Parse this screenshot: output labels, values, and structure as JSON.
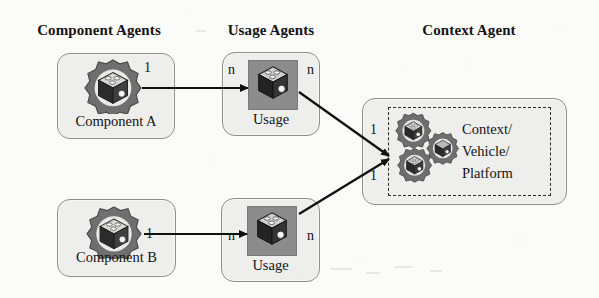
{
  "diagram": {
    "columns": [
      {
        "id": "component-agents",
        "label": "Component Agents"
      },
      {
        "id": "usage-agents",
        "label": "Usage Agents"
      },
      {
        "id": "context-agent",
        "label": "Context Agent"
      }
    ],
    "nodes": [
      {
        "id": "component-a",
        "label": "Component A",
        "column": "component-agents",
        "icon": "component-cube-gear-icon"
      },
      {
        "id": "component-b",
        "label": "Component B",
        "column": "component-agents",
        "icon": "component-cube-gear-icon"
      },
      {
        "id": "usage-a",
        "label": "Usage",
        "column": "usage-agents",
        "icon": "usage-cube-icon"
      },
      {
        "id": "usage-b",
        "label": "Usage",
        "column": "usage-agents",
        "icon": "usage-cube-icon"
      },
      {
        "id": "context",
        "label_lines": [
          "Context/",
          "Vehicle/",
          "Platform"
        ],
        "label": "Context/ Vehicle/ Platform",
        "column": "context-agent",
        "icon": "context-multi-gear-icon"
      }
    ],
    "edges": [
      {
        "id": "component-a-to-usage-a",
        "from": "component-a",
        "to": "usage-a",
        "source_multiplicity": "1",
        "target_multiplicity": "n",
        "style": "solid-arrow"
      },
      {
        "id": "component-b-to-usage-b",
        "from": "component-b",
        "to": "usage-b",
        "source_multiplicity": "1",
        "target_multiplicity": "n",
        "style": "solid-arrow"
      },
      {
        "id": "usage-a-to-context",
        "from": "usage-a",
        "to": "context",
        "source_multiplicity": "n",
        "target_multiplicity": "1",
        "style": "solid-arrow"
      },
      {
        "id": "usage-b-to-context",
        "from": "usage-b",
        "to": "context",
        "source_multiplicity": "n",
        "target_multiplicity": "1",
        "style": "solid-arrow"
      }
    ],
    "multiplicities": {
      "component_a_out": "1",
      "component_b_out": "1",
      "usage_a_in": "n",
      "usage_a_out": "n",
      "usage_b_in": "n",
      "usage_b_out": "n",
      "context_in_top": "1",
      "context_in_bottom": "1"
    },
    "colors": {
      "background": "#fbfbf9",
      "box_fill": "#eeeeec",
      "box_border": "#8d8d8d",
      "tile_fill": "#8c8c8c",
      "icon_gray": "#7c7c7c",
      "icon_dark": "#3a3a3a",
      "arrow": "#101010",
      "text": "#141414",
      "dashed_border": "#2b2b2b"
    }
  }
}
